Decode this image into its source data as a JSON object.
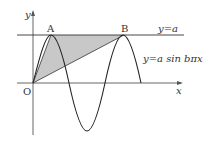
{
  "diagram": {
    "labels": {
      "y_axis": "y",
      "x_axis": "x",
      "origin": "O",
      "point_a": "A",
      "point_b": "B",
      "line_label": "y=a",
      "curve_label": "y=a sin bπx"
    },
    "colors": {
      "shade": "#c8c8c8",
      "line": "#333333"
    }
  }
}
